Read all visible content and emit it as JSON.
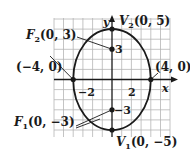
{
  "figure": {
    "type": "ellipse-graph",
    "equation_params": {
      "a": 5,
      "b": 4,
      "c": 3,
      "major_axis": "vertical"
    },
    "axes": {
      "x_label": "x",
      "y_label": "y",
      "x_ticks": [
        "−2",
        "2"
      ],
      "y_ticks": [
        "3",
        "−3"
      ]
    },
    "grid": {
      "x_range": [
        -6,
        6
      ],
      "y_range": [
        -6,
        6
      ],
      "step": 1
    },
    "points": [
      {
        "id": "F2",
        "name": "F",
        "sub": "2",
        "coords": "(0, 3)",
        "x": 0,
        "y": 3
      },
      {
        "id": "V2",
        "name": "V",
        "sub": "2",
        "coords": "(0, 5)",
        "x": 0,
        "y": 5
      },
      {
        "id": "left",
        "name": "",
        "sub": "",
        "coords": "(−4, 0)",
        "x": -4,
        "y": 0
      },
      {
        "id": "right",
        "name": "",
        "sub": "",
        "coords": "(4, 0)",
        "x": 4,
        "y": 0
      },
      {
        "id": "F1",
        "name": "F",
        "sub": "1",
        "coords": "(0, −3)",
        "x": 0,
        "y": -3
      },
      {
        "id": "V1",
        "name": "V",
        "sub": "1",
        "coords": "(0, −5)",
        "x": 0,
        "y": -5
      }
    ],
    "colors": {
      "curve": "#1a1a1a",
      "grid": "#b0b0b0",
      "axis": "#1a1a1a"
    }
  },
  "labels": {
    "F2_name": "F",
    "F2_sub": "2",
    "F2_coords": "(0, 3)",
    "V2_name": "V",
    "V2_sub": "2",
    "V2_coords": "(0, 5)",
    "left_coords": "(−4, 0)",
    "right_coords": "(4, 0)",
    "F1_name": "F",
    "F1_sub": "1",
    "F1_coords": "(0, −3)",
    "V1_name": "V",
    "V1_sub": "1",
    "V1_coords": "(0, −5)",
    "tick_xneg2": "−2",
    "tick_x2": "2",
    "tick_y3": "3",
    "tick_yneg3": "−3",
    "x_axis": "x",
    "y_axis": "y"
  }
}
